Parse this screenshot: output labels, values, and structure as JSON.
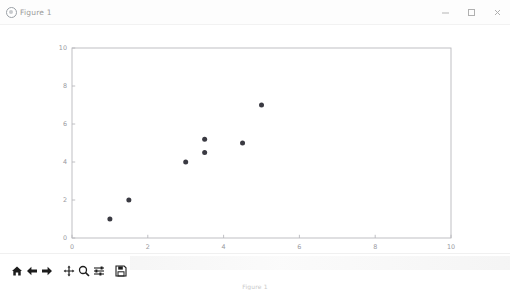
{
  "window": {
    "title": "Figure 1",
    "app_icon": "figure-icon",
    "controls": [
      {
        "name": "minimize",
        "glyph": "minimize-icon"
      },
      {
        "name": "maximize",
        "glyph": "maximize-icon"
      },
      {
        "name": "close",
        "glyph": "close-icon"
      }
    ]
  },
  "toolbar": {
    "buttons": [
      {
        "name": "home",
        "label": "Home",
        "icon": "home-icon"
      },
      {
        "name": "back",
        "label": "Back",
        "icon": "arrow-left-icon"
      },
      {
        "name": "forward",
        "label": "Forward",
        "icon": "arrow-right-icon"
      },
      {
        "name": "pan",
        "label": "Pan",
        "icon": "move-cross-icon"
      },
      {
        "name": "zoom",
        "label": "Zoom to rectangle",
        "icon": "magnifier-icon"
      },
      {
        "name": "subplots",
        "label": "Configure subplots",
        "icon": "sliders-icon"
      },
      {
        "name": "save",
        "label": "Save the figure",
        "icon": "floppy-disk-icon"
      }
    ]
  },
  "chart_data": {
    "type": "scatter",
    "title": "",
    "xlabel": "",
    "ylabel": "",
    "xlim": [
      0,
      10
    ],
    "ylim": [
      0,
      10
    ],
    "xticks": [
      0,
      2,
      4,
      6,
      8,
      10
    ],
    "yticks": [
      0,
      2,
      4,
      6,
      8,
      10
    ],
    "xticklabels": [
      "0",
      "2",
      "4",
      "6",
      "8",
      "10"
    ],
    "yticklabels": [
      "0",
      "2",
      "4",
      "6",
      "8",
      "10"
    ],
    "grid": false,
    "legend": null,
    "marker": "o",
    "marker_color": "#3a3a42",
    "marker_size": 4,
    "x": [
      1,
      1.5,
      3,
      3.5,
      3.5,
      4.5,
      5
    ],
    "y": [
      1,
      2,
      4,
      4.5,
      5.2,
      5,
      7
    ],
    "points": [
      {
        "x": 1,
        "y": 1
      },
      {
        "x": 1.5,
        "y": 2
      },
      {
        "x": 3,
        "y": 4
      },
      {
        "x": 3.5,
        "y": 4.5
      },
      {
        "x": 3.5,
        "y": 5.2
      },
      {
        "x": 4.5,
        "y": 5
      },
      {
        "x": 5,
        "y": 7
      }
    ]
  },
  "style": {
    "axes_color": "#b9b9bd",
    "tick_label_color": "#9a9a9f",
    "figure_facecolor": "#ffffff",
    "axes_facecolor": "#ffffff"
  }
}
